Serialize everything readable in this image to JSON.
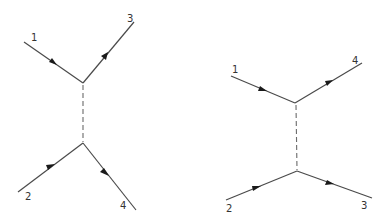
{
  "diagrams": [
    {
      "name": "left-feynman-diagram",
      "labels": {
        "p1": "1",
        "p2": "2",
        "p3": "3",
        "p4": "4"
      }
    },
    {
      "name": "right-feynman-diagram",
      "labels": {
        "p1": "1",
        "p2": "2",
        "p3": "3",
        "p4": "4"
      }
    }
  ]
}
